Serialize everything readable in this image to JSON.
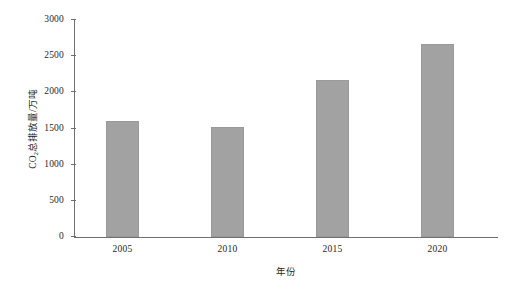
{
  "chart_data": {
    "type": "bar",
    "title": "",
    "subtitle": "",
    "categories": [
      "2005",
      "2010",
      "2015",
      "2020"
    ],
    "values": [
      1600,
      1520,
      2170,
      2670
    ],
    "xlabel": "年份",
    "ylabel_prefix": "CO",
    "ylabel_sub": "2",
    "ylabel_suffix": "总排放量/万吨",
    "ylabel_full": "CO2总排放量/万吨",
    "ylim": [
      0,
      3000
    ],
    "yticks": [
      0,
      500,
      1000,
      1500,
      2000,
      2500,
      3000
    ],
    "ytick_labels": [
      "0",
      "500",
      "1000",
      "1500",
      "2000",
      "2500",
      "3000"
    ],
    "grid": false,
    "legend": null,
    "bar_color": "#a2a2a2",
    "axis_color": "#6f6f6f",
    "background": "#ffffff",
    "series": [
      {
        "name": "CO2总排放量",
        "values": [
          1600,
          1520,
          2170,
          2670
        ]
      }
    ]
  }
}
